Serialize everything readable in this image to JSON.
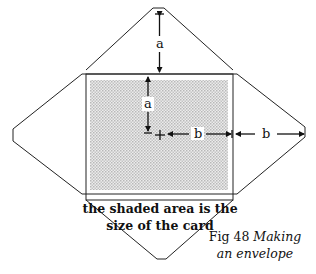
{
  "diagram": {
    "labels": {
      "top_dimension": "a",
      "inner_vertical_dimension": "a",
      "inner_horizontal_dimension": "b",
      "outer_horizontal_dimension": "b"
    },
    "shaded_note": {
      "line1": "the shaded area is the",
      "line2": "size of the card"
    },
    "caption": {
      "fig": "Fig 48",
      "title_line1": "Making",
      "title_line2": "an envelope"
    },
    "colors": {
      "line": "#222222",
      "shade": "#d6d6d6",
      "background": "#ffffff"
    }
  }
}
